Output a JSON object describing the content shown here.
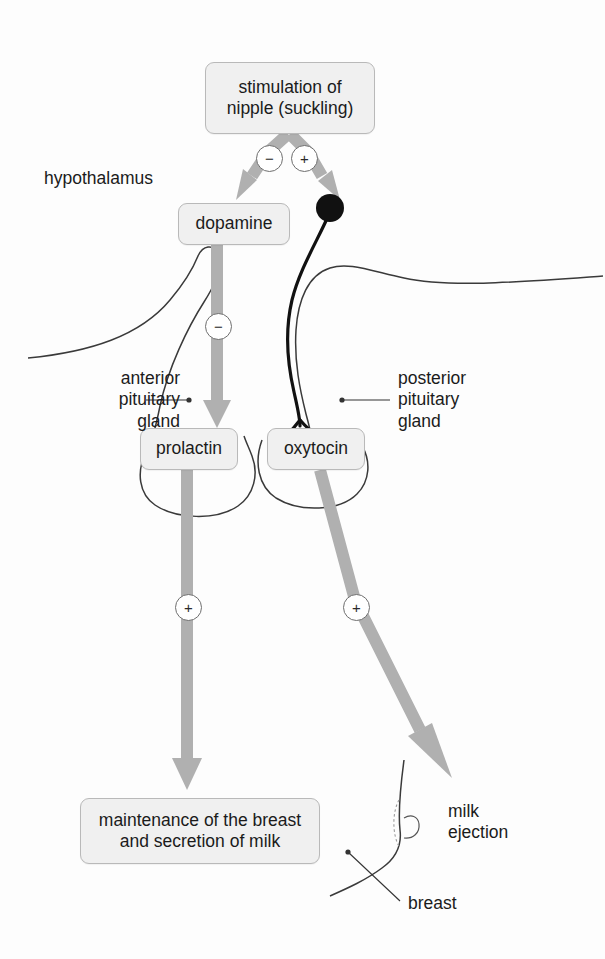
{
  "diagram": {
    "colors": {
      "box_fill": "#f0f0f0",
      "box_border": "#b9b9b9",
      "arrow_gray": "#b0b0b0",
      "neuron_black": "#111111",
      "outline_gray": "#3a3a3a",
      "text": "#1b1b1b",
      "background": "#fdfdfd"
    },
    "nodes": {
      "stimulation": "stimulation of\nnipple (suckling)",
      "dopamine": "dopamine",
      "prolactin": "prolactin",
      "oxytocin": "oxytocin",
      "maintenance": "maintenance of the breast\nand secretion of milk"
    },
    "labels": {
      "hypothalamus": "hypothalamus",
      "anterior_pituitary": "anterior\npituitary\ngland",
      "posterior_pituitary": "posterior\npituitary\ngland",
      "milk_ejection": "milk\nejection",
      "breast": "breast"
    },
    "signs": {
      "minus_top": "−",
      "plus_top": "+",
      "minus_dopamine": "−",
      "plus_prolactin": "+",
      "plus_oxytocin": "+"
    },
    "edges": [
      {
        "from": "stimulation",
        "to": "dopamine",
        "sign": "−",
        "style": "gray-arrow"
      },
      {
        "from": "stimulation",
        "to": "oxytocin-neuron",
        "sign": "+",
        "style": "gray-arrow"
      },
      {
        "from": "dopamine",
        "to": "prolactin",
        "sign": "−",
        "style": "gray-arrow"
      },
      {
        "from": "prolactin",
        "to": "maintenance",
        "sign": "+",
        "style": "gray-arrow"
      },
      {
        "from": "oxytocin",
        "to": "milk ejection",
        "sign": "+",
        "style": "gray-arrow"
      }
    ]
  }
}
